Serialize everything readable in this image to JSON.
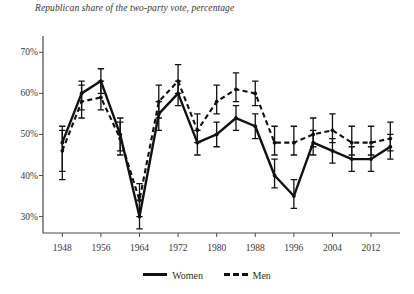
{
  "chart_data": {
    "type": "line",
    "title": "Republican share of the two-party vote, percentage",
    "xlabel": "",
    "ylabel": "",
    "xlim": [
      1944,
      2018
    ],
    "ylim": [
      26,
      73
    ],
    "grid": false,
    "legend_position": "bottom-center",
    "x": [
      1948,
      1952,
      1956,
      1960,
      1964,
      1968,
      1972,
      1976,
      1980,
      1984,
      1988,
      1992,
      1996,
      2000,
      2004,
      2008,
      2012,
      2016
    ],
    "xticks": [
      1948,
      1956,
      1964,
      1972,
      1980,
      1988,
      1996,
      2004,
      2012
    ],
    "xtick_labels": [
      "1948",
      "1956",
      "1964",
      "1972",
      "1980",
      "1988",
      "1996",
      "2004",
      "2012"
    ],
    "yticks": [
      30,
      40,
      50,
      60,
      70
    ],
    "ytick_labels": [
      "30%",
      "40%",
      "50%",
      "60%",
      "70%"
    ],
    "series": [
      {
        "name": "Women",
        "style": "solid",
        "color": "#111111",
        "values": [
          48,
          60,
          63,
          50,
          30,
          55,
          60,
          48,
          50,
          54,
          52,
          40,
          35,
          48,
          46,
          44,
          44,
          47
        ],
        "err_low": [
          39,
          56,
          60,
          46,
          27,
          51,
          57,
          45,
          47,
          51,
          49,
          37,
          32,
          45,
          43,
          41,
          41,
          44
        ],
        "err_high": [
          52,
          63,
          66,
          54,
          34,
          58,
          63,
          51,
          53,
          57,
          55,
          44,
          39,
          51,
          49,
          47,
          47,
          50
        ]
      },
      {
        "name": "Men",
        "style": "dashed",
        "color": "#111111",
        "values": [
          46,
          58,
          59,
          49,
          34,
          58,
          63,
          51,
          58,
          61,
          60,
          48,
          48,
          50,
          51,
          48,
          48,
          49
        ],
        "err_low": [
          41,
          54,
          56,
          45,
          30,
          54,
          60,
          48,
          55,
          58,
          57,
          45,
          45,
          47,
          48,
          45,
          45,
          46
        ],
        "err_high": [
          51,
          62,
          63,
          53,
          38,
          62,
          67,
          55,
          62,
          65,
          63,
          52,
          52,
          54,
          55,
          52,
          52,
          53
        ]
      }
    ]
  },
  "legend": {
    "items": [
      {
        "label": "Women",
        "style": "solid"
      },
      {
        "label": "Men",
        "style": "dashed"
      }
    ]
  }
}
